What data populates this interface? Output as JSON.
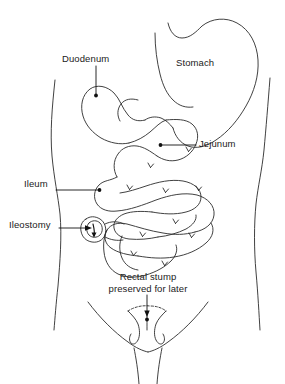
{
  "figure": {
    "kind": "medical-anatomy-line-drawing",
    "line_color": "#2b2b2b",
    "background_color": "#ffffff",
    "fill_color": "none"
  },
  "labels": {
    "duodenum": "Duodenum",
    "stomach": "Stomach",
    "jejunum": "Jejunum",
    "ileum": "Ileum",
    "ileostomy": "Ileostomy",
    "rectal_stump_line1": "Rectal stump",
    "rectal_stump_line2": "preserved for later"
  },
  "annotations": [
    {
      "label": "Duodenum",
      "leader": "vertical-down",
      "has_dot": true,
      "has_arrow": false
    },
    {
      "label": "Stomach",
      "leader": "none",
      "has_dot": false,
      "has_arrow": false
    },
    {
      "label": "Jejunum",
      "leader": "horizontal-left",
      "has_dot": true,
      "has_arrow": false
    },
    {
      "label": "Ileum",
      "leader": "horizontal-right",
      "has_dot": true,
      "has_arrow": false
    },
    {
      "label": "Ileostomy",
      "leader": "horizontal-right",
      "has_dot": false,
      "has_arrow": true
    },
    {
      "label": "Rectal stump preserved for later",
      "leader": "vertical-down",
      "has_dot": true,
      "has_arrow": true
    }
  ],
  "structures": [
    "body-torso-outline",
    "stomach",
    "duodenum",
    "jejunum",
    "ileum-loops",
    "ileostomy-stoma",
    "rectal-stump",
    "groin-crease"
  ]
}
